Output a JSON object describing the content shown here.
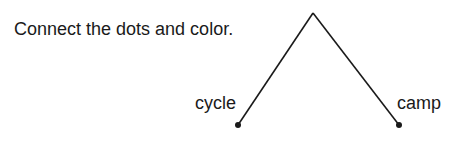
{
  "instruction": "Connect the dots and color.",
  "words": {
    "left": "cycle",
    "right": "camp"
  },
  "shape": {
    "type": "open-triangle",
    "stroke_color": "#1a1a1a",
    "apex": [
      313,
      13
    ],
    "left_dot": [
      238,
      125
    ],
    "right_dot": [
      399,
      125
    ]
  }
}
